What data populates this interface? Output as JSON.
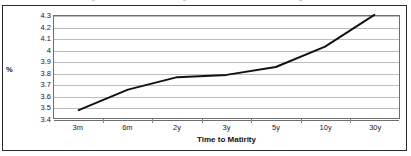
{
  "chart_data": {
    "type": "line",
    "title": "",
    "xlabel": "Time to Matirity",
    "ylabel": "%",
    "categories": [
      "3m",
      "6m",
      "2y",
      "3y",
      "5y",
      "10y",
      "30y"
    ],
    "series": [
      {
        "name": "Yield",
        "values": [
          3.47,
          3.65,
          3.76,
          3.78,
          3.85,
          4.03,
          4.31
        ]
      }
    ],
    "ylim": [
      3.4,
      4.3
    ],
    "ytick_labels": [
      "4.3",
      "4.2",
      "4.1",
      "4",
      "3.9",
      "3.8",
      "3.7",
      "3.6",
      "3.5",
      "3.4"
    ],
    "ytick_values": [
      4.3,
      4.2,
      4.1,
      4.0,
      3.9,
      3.8,
      3.7,
      3.6,
      3.5,
      3.4
    ],
    "ytick_step": 0.1,
    "grid": true,
    "grid_axis": "y",
    "legend": false,
    "legend_position": "none",
    "markers": false,
    "line_color": "#111111",
    "grid_color": "#bdbdbd",
    "plot_border_color": "#6e6e6e",
    "frame_color": "#2a2a2a",
    "background_color": "#ffffff"
  }
}
